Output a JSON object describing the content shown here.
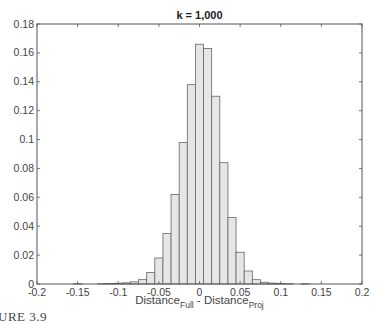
{
  "chart_data": {
    "type": "bar",
    "title": "k = 1,000",
    "xlabel": "Distance_Full - Distance_Proj",
    "xlabel_parts": {
      "main1": "Distance",
      "sub1": "Full",
      "mid": " - Distance",
      "sub2": "Proj"
    },
    "ylabel": "",
    "xlim": [
      -0.2,
      0.2
    ],
    "ylim": [
      0,
      0.18
    ],
    "xticks": [
      -0.2,
      -0.15,
      -0.1,
      -0.05,
      0,
      0.05,
      0.1,
      0.15,
      0.2
    ],
    "xtick_labels": [
      "-0.2",
      "-0.15",
      "-0.1",
      "-0.05",
      "0",
      "0.05",
      "0.1",
      "0.15",
      "0.2"
    ],
    "yticks": [
      0,
      0.02,
      0.04,
      0.06,
      0.08,
      0.1,
      0.12,
      0.14,
      0.16,
      0.18
    ],
    "ytick_labels": [
      "0",
      "0.02",
      "0.04",
      "0.06",
      "0.08",
      "0.1",
      "0.12",
      "0.14",
      "0.16",
      "0.18"
    ],
    "grid": false,
    "bin_width": 0.01,
    "categories": [
      -0.15,
      -0.12,
      -0.11,
      -0.1,
      -0.09,
      -0.08,
      -0.07,
      -0.06,
      -0.05,
      -0.04,
      -0.03,
      -0.02,
      -0.01,
      0.0,
      0.01,
      0.02,
      0.03,
      0.04,
      0.05,
      0.06,
      0.07,
      0.08,
      0.09,
      0.1,
      0.11,
      0.13
    ],
    "values": [
      0.0002,
      0.0002,
      0.0003,
      0.0005,
      0.0008,
      0.0015,
      0.003,
      0.008,
      0.018,
      0.035,
      0.062,
      0.098,
      0.138,
      0.166,
      0.163,
      0.13,
      0.084,
      0.046,
      0.022,
      0.009,
      0.003,
      0.0012,
      0.0006,
      0.0004,
      0.0002,
      0.0002
    ],
    "bar_fill": "#e6e6e6",
    "bar_edge": "#666666"
  },
  "caption": "URE 3.9"
}
